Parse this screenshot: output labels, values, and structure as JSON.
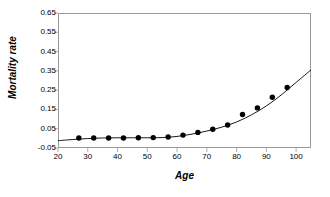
{
  "chart_data": {
    "type": "scatter",
    "title": "",
    "xlabel": "Age",
    "ylabel": "Mortality rate",
    "xlim": [
      20,
      105
    ],
    "ylim": [
      -0.05,
      0.65
    ],
    "xticks": [
      20,
      30,
      40,
      50,
      60,
      70,
      80,
      90,
      100
    ],
    "xtick_labels": [
      "20",
      "30",
      "40",
      "50",
      "60",
      "70",
      "80",
      "90",
      "100"
    ],
    "yticks": [
      -0.05,
      0.05,
      0.15,
      0.25,
      0.35,
      0.45,
      0.55,
      0.65
    ],
    "ytick_labels": [
      "-0.05",
      "0.05",
      "0.15",
      "0.25",
      "0.35",
      "0.45",
      "0.55",
      "0.65"
    ],
    "grid": false,
    "legend": "none",
    "series": [
      {
        "name": "Observed mortality rate",
        "marker": "filled-circle",
        "marker_color": "#000000",
        "x": [
          27,
          32,
          37,
          42,
          47,
          52,
          57,
          62,
          67,
          72,
          77,
          82,
          87,
          92,
          97
        ],
        "y": [
          0.002,
          0.002,
          0.002,
          0.002,
          0.003,
          0.004,
          0.007,
          0.017,
          0.031,
          0.047,
          0.069,
          0.124,
          0.158,
          0.213,
          0.264
        ]
      },
      {
        "name": "Fitted exponential curve",
        "marker": "none",
        "line_color": "#000000",
        "x": [
          20,
          25,
          30,
          35,
          40,
          45,
          50,
          55,
          60,
          65,
          70,
          75,
          80,
          85,
          90,
          95,
          100,
          105
        ],
        "y": [
          -0.012,
          -0.006,
          -0.001,
          0.002,
          0.003,
          0.003,
          0.003,
          0.004,
          0.01,
          0.022,
          0.038,
          0.058,
          0.085,
          0.122,
          0.168,
          0.225,
          0.29,
          0.355
        ]
      }
    ]
  },
  "axis_titles": {
    "y": "Mortality rate",
    "x": "Age"
  },
  "colors": {
    "frame": "#9a9a9a",
    "marker": "#000000",
    "curve": "#000000",
    "background": "#ffffff",
    "text": "#000000"
  }
}
